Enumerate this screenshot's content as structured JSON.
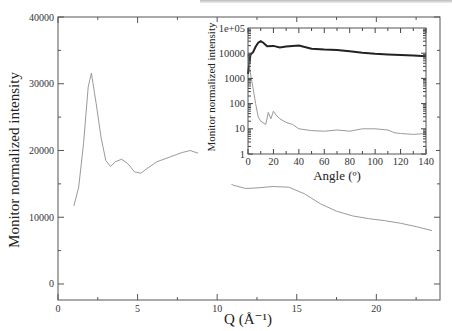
{
  "chart_data": [
    {
      "type": "line",
      "title": "",
      "xlabel": "Q (Å⁻¹)",
      "ylabel": "Monitor normalized intensity",
      "xlim": [
        0,
        24
      ],
      "ylim": [
        -2400,
        40000
      ],
      "xticks": [
        0,
        5,
        10,
        15,
        20
      ],
      "yticks": [
        0,
        10000,
        20000,
        30000,
        40000
      ],
      "grid": false,
      "series": [
        {
          "name": "I(Q)",
          "color": "#9a9a9a",
          "x": [
            1.0,
            1.3,
            1.6,
            1.9,
            2.1,
            2.4,
            2.7,
            3.0,
            3.3,
            3.6,
            4.0,
            4.4,
            4.8,
            5.2,
            5.6,
            6.2,
            7.0,
            7.8,
            8.3,
            8.8,
            9.5,
            10.2,
            11.0,
            11.8,
            12.5,
            13.5,
            14.5,
            15.5,
            16.5,
            17.5,
            18.5,
            19.5,
            20.5,
            21.5,
            22.5,
            23.5
          ],
          "y": [
            11700,
            14500,
            21000,
            29500,
            31600,
            27000,
            22000,
            18500,
            17600,
            18300,
            18700,
            18000,
            16800,
            16600,
            17300,
            18300,
            19000,
            19700,
            20000,
            19600,
            18000,
            16200,
            14800,
            14300,
            14400,
            14600,
            14500,
            13500,
            12000,
            10900,
            10200,
            9800,
            9500,
            9100,
            8600,
            8000
          ]
        }
      ]
    },
    {
      "type": "line",
      "title": "",
      "xlabel": "Angle (º)",
      "ylabel": "Monitor normalized intensity",
      "xlim": [
        0,
        140
      ],
      "ylim": [
        1,
        100000
      ],
      "yscale": "log",
      "xticks": [
        0,
        20,
        40,
        60,
        80,
        100,
        120,
        140
      ],
      "yticks": [
        1,
        10,
        100,
        1000,
        10000,
        100000
      ],
      "ytick_labels": [
        "1",
        "10",
        "100",
        "1000",
        "10000",
        "1e+05"
      ],
      "legend_position": "none",
      "series": [
        {
          "name": "sample",
          "color": "#222222",
          "x": [
            0,
            2,
            4,
            6,
            8,
            10,
            12,
            15,
            20,
            25,
            30,
            40,
            50,
            60,
            70,
            80,
            90,
            100,
            110,
            120,
            130,
            140
          ],
          "y": [
            1500,
            9000,
            11000,
            18000,
            26000,
            30000,
            26000,
            19000,
            19500,
            17000,
            18500,
            20000,
            15000,
            14000,
            13500,
            12000,
            10500,
            9500,
            9000,
            8500,
            8000,
            7500
          ]
        },
        {
          "name": "empty",
          "color": "#9a9a9a",
          "x": [
            0,
            2,
            4,
            6,
            8,
            10,
            14,
            16,
            18,
            20,
            22,
            25,
            30,
            35,
            40,
            50,
            60,
            70,
            80,
            90,
            100,
            110,
            115,
            120,
            130,
            140
          ],
          "y": [
            9000,
            1500,
            400,
            100,
            30,
            20,
            15,
            45,
            25,
            50,
            35,
            25,
            18,
            15,
            10,
            8.5,
            8,
            9,
            8,
            10,
            10,
            9,
            7,
            6.5,
            6,
            6.5
          ]
        }
      ]
    }
  ]
}
